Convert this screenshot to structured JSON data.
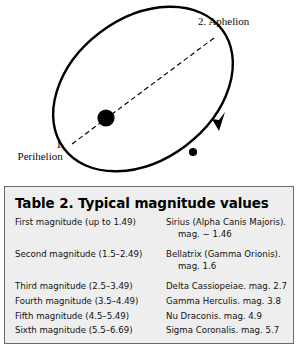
{
  "figure": {
    "name": "elliptical-orbit-diagram",
    "labels": {
      "aphelion": "2.  Aphelion",
      "perihelion_number": "1.",
      "perihelion_word": "Perihelion"
    },
    "colors": {
      "stroke": "#000000",
      "sun": "#000000",
      "planet": "#000000"
    }
  },
  "table": {
    "title": "Table 2.  Typical magnitude values",
    "background": "#eeeeee",
    "border": "#6b6b6b",
    "rows": [
      {
        "magnitude": "First magnitude (up to 1.49)",
        "example": "Sirius (Alpha Canis Majoris).",
        "example_cont": "mag. − 1.46"
      },
      {
        "magnitude": "Second magnitude (1.5–2.49)",
        "example": "Bellatrix (Gamma Orionis).",
        "example_cont": "mag. 1.6"
      },
      {
        "magnitude": "Third magnitude (2.5–3.49)",
        "example": "Delta Cassiopeiae. mag. 2.7",
        "example_cont": ""
      },
      {
        "magnitude": "Fourth magnitude (3.5–4.49)",
        "example": "Gamma Herculis. mag. 3.8",
        "example_cont": ""
      },
      {
        "magnitude": "Fifth magnitude (4.5–5.49)",
        "example": "Nu Draconis. mag. 4.9",
        "example_cont": ""
      },
      {
        "magnitude": "Sixth magnitude (5.5–6.69)",
        "example": "Sigma Coronalis. mag. 5.7",
        "example_cont": ""
      }
    ]
  }
}
